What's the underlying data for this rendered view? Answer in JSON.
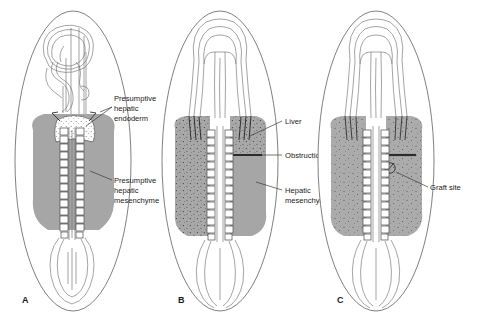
{
  "figure": {
    "type": "anatomical-diagram",
    "background_color": "#ffffff",
    "mesenchyme_color": "#a6a6a6",
    "stipple_color": "#9d9d9d",
    "outline_color": "#555555",
    "ink_color": "#1a1a1a"
  },
  "panels": [
    {
      "id": "A",
      "letter": "A",
      "label_x": 22,
      "label_y": 303,
      "annotations": [
        {
          "key": "presumptive-hepatic-endoderm",
          "lines": [
            "Presumptive",
            "hepatic",
            "endoderm"
          ],
          "text_x": 114,
          "text_y": 100,
          "leader": "M 112,112 L 100,117 M 112,112 L 86,127"
        },
        {
          "key": "presumptive-hepatic-mesenchyme",
          "lines": [
            "Presumptive",
            "hepatic",
            "mesenchyme"
          ],
          "text_x": 114,
          "text_y": 180,
          "leader": "M 112,183 L 90,172"
        }
      ]
    },
    {
      "id": "B",
      "letter": "B",
      "label_x": 178,
      "label_y": 303,
      "annotations": [
        {
          "key": "liver",
          "lines": [
            "Liver"
          ],
          "text_x": 285,
          "text_y": 124,
          "leader": "M 283,121 L 250,136"
        },
        {
          "key": "obstruction",
          "lines": [
            "Obstruction"
          ],
          "text_x": 285,
          "text_y": 158,
          "leader": "M 283,155 L 262,155"
        },
        {
          "key": "hepatic-mesenchyme",
          "lines": [
            "Hepatic",
            "mesenchyme"
          ],
          "text_x": 285,
          "text_y": 190,
          "leader": "M 283,191 L 255,183"
        }
      ]
    },
    {
      "id": "C",
      "letter": "C",
      "label_x": 337,
      "label_y": 303,
      "annotations": [
        {
          "key": "graft-site",
          "lines": [
            "Graft site"
          ],
          "text_x": 430,
          "text_y": 190,
          "leader": "M 428,187 L 398,172"
        }
      ]
    }
  ],
  "legend_keys": [
    "Presumptive hepatic endoderm",
    "Presumptive hepatic mesenchyme",
    "Liver",
    "Obstruction",
    "Hepatic mesenchyme",
    "Graft site"
  ]
}
